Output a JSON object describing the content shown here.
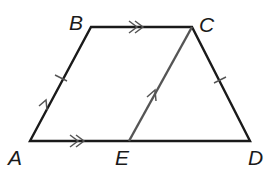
{
  "figure": {
    "type": "trapezoid-with-segment",
    "points": {
      "A": {
        "label": "A",
        "x": 30,
        "y": 141
      },
      "B": {
        "label": "B",
        "x": 91,
        "y": 27
      },
      "C": {
        "label": "C",
        "x": 192,
        "y": 27
      },
      "D": {
        "label": "D",
        "x": 250,
        "y": 141
      },
      "E": {
        "label": "E",
        "x": 129,
        "y": 141
      }
    },
    "segments": [
      "AB",
      "BC",
      "CD",
      "DA",
      "EC"
    ],
    "markings": {
      "parallel_single_arrow": [
        "AB",
        "EC"
      ],
      "parallel_double_arrow": [
        "BC",
        "AD"
      ],
      "congruent_tick": [
        "AB",
        "CD"
      ]
    },
    "colors": {
      "main": "#1a1a1a",
      "segment_EC": "#555555"
    }
  }
}
